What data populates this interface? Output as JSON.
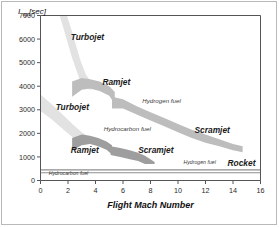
{
  "figure": {
    "border_color": "#b9b9b9",
    "background": "#ffffff"
  },
  "chart_data": {
    "type": "area",
    "title": "",
    "subtitle": "",
    "xlabel": "Flight Mach Number",
    "ylabel": "I",
    "ylabel_sub": "sp",
    "ylabel_unit": "[sec]",
    "xlim": [
      0,
      16
    ],
    "ylim": [
      0,
      7000
    ],
    "xticks": [
      0,
      2,
      4,
      6,
      8,
      10,
      12,
      14,
      16
    ],
    "xtick_labels": [
      "0",
      "2",
      "4",
      "6",
      "8",
      "10",
      "12",
      "14",
      "16"
    ],
    "yticks": [
      0,
      1000,
      2000,
      3000,
      4000,
      5000,
      6000,
      7000
    ],
    "ytick_labels": [
      "0",
      "1000",
      "2000",
      "3000",
      "4000",
      "5000",
      "6000",
      "7000"
    ],
    "grid": false,
    "legend_position": "inline-annotations",
    "colors": {
      "hydrogen_band_light": "#e2e2e2",
      "hydrogen_band": "#c3c3c3",
      "hydrocarbon_band": "#a8a8a8",
      "rocket_line": "#8e8e8e",
      "axis": "#555555"
    },
    "series": [
      {
        "name": "Turbojet (hydrogen fuel)",
        "fuel": "Hydrogen fuel",
        "color": "#e2e2e2",
        "x": [
          0.9,
          1.6,
          2.3,
          2.9,
          3.3,
          3.6,
          3.9
        ],
        "y_upper": [
          8600,
          7600,
          6300,
          5100,
          4500,
          4250,
          4150
        ],
        "y_lower": [
          7900,
          6600,
          5200,
          4200,
          3950,
          3850,
          3900
        ]
      },
      {
        "name": "Ramjet (hydrogen fuel)",
        "fuel": "Hydrogen fuel",
        "color": "#bdbdbd",
        "x": [
          2.3,
          3.0,
          3.6,
          4.3,
          5.0,
          5.4
        ],
        "y_upper": [
          4200,
          4350,
          4300,
          4200,
          4000,
          3750
        ],
        "y_lower": [
          3550,
          3850,
          3900,
          3800,
          3600,
          3250
        ]
      },
      {
        "name": "Scramjet (hydrogen fuel)",
        "fuel": "Hydrogen fuel",
        "color": "#bdbdbd",
        "x": [
          5.2,
          6.0,
          7.0,
          8.0,
          9.0,
          10.0,
          11.0,
          12.0,
          13.0,
          14.0,
          14.7
        ],
        "y_upper": [
          3550,
          3450,
          3150,
          2900,
          2650,
          2400,
          2150,
          1950,
          1750,
          1550,
          1450
        ],
        "y_lower": [
          3050,
          3050,
          2800,
          2550,
          2300,
          2050,
          1800,
          1600,
          1450,
          1280,
          1200
        ]
      },
      {
        "name": "Turbojet (hydrocarbon fuel)",
        "fuel": "Hydrocarbon fuel",
        "color": "#e2e2e2",
        "x": [
          0.0,
          0.8,
          1.6,
          2.4,
          3.0,
          3.4
        ],
        "y_upper": [
          3650,
          3250,
          2800,
          2350,
          2050,
          1900
        ],
        "y_lower": [
          2950,
          2600,
          2200,
          1800,
          1600,
          1550
        ]
      },
      {
        "name": "Ramjet (hydrocarbon fuel)",
        "fuel": "Hydrocarbon fuel",
        "color": "#9e9e9e",
        "x": [
          2.3,
          3.0,
          3.6,
          4.2,
          4.8,
          5.2
        ],
        "y_upper": [
          1800,
          1950,
          1900,
          1800,
          1650,
          1500
        ],
        "y_lower": [
          1280,
          1500,
          1550,
          1450,
          1300,
          1100
        ]
      },
      {
        "name": "Scramjet (hydrocarbon fuel)",
        "fuel": "Hydrocarbon fuel",
        "color": "#9e9e9e",
        "x": [
          5.1,
          5.8,
          6.5,
          7.1,
          7.6,
          8.3
        ],
        "y_upper": [
          1450,
          1380,
          1280,
          1180,
          1050,
          780
        ],
        "y_lower": [
          1080,
          1000,
          900,
          830,
          700,
          700
        ]
      },
      {
        "name": "Rocket (hydrogen fuel)",
        "fuel": "Hydrogen fuel",
        "color": "#8e8e8e",
        "type": "line",
        "x": [
          0,
          16
        ],
        "y": [
          450,
          450
        ]
      },
      {
        "name": "Rocket (hydrocarbon fuel)",
        "fuel": "Hydrocarbon fuel",
        "color": "#8e8e8e",
        "type": "line",
        "x": [
          0,
          16
        ],
        "y": [
          330,
          330
        ]
      }
    ],
    "annotations": [
      {
        "id": "turbojet-h2",
        "text": "Turbojet",
        "x": 2.2,
        "y": 5950,
        "style": "band"
      },
      {
        "id": "ramjet-h2",
        "text": "Ramjet",
        "x": 4.5,
        "y": 4050,
        "style": "band"
      },
      {
        "id": "hydrogen-fuel-mid",
        "text": "Hydrogen fuel",
        "x": 7.4,
        "y": 3300,
        "style": "fuel"
      },
      {
        "id": "scramjet-h2",
        "text": "Scramjet",
        "x": 11.2,
        "y": 2000,
        "style": "band"
      },
      {
        "id": "turbojet-hc",
        "text": "Turbojet",
        "x": 1.1,
        "y": 3000,
        "style": "band"
      },
      {
        "id": "hydrocarbon-fuel-mid",
        "text": "Hydrocarbon fuel",
        "x": 4.6,
        "y": 2120,
        "style": "fuel"
      },
      {
        "id": "ramjet-hc",
        "text": "Ramjet",
        "x": 2.2,
        "y": 1180,
        "style": "band"
      },
      {
        "id": "scramjet-hc",
        "text": "Scramjet",
        "x": 7.1,
        "y": 1180,
        "style": "band"
      },
      {
        "id": "hydrogen-fuel-rkt",
        "text": "Hydrogen fuel",
        "x": 10.4,
        "y": 700,
        "style": "fuel-sm"
      },
      {
        "id": "rocket",
        "text": "Rocket",
        "x": 13.6,
        "y": 620,
        "style": "band"
      },
      {
        "id": "hydrocarbon-fuel-rkt",
        "text": "Hydrocarbon fuel",
        "x": 0.6,
        "y": 250,
        "style": "fuel-sm"
      }
    ]
  }
}
